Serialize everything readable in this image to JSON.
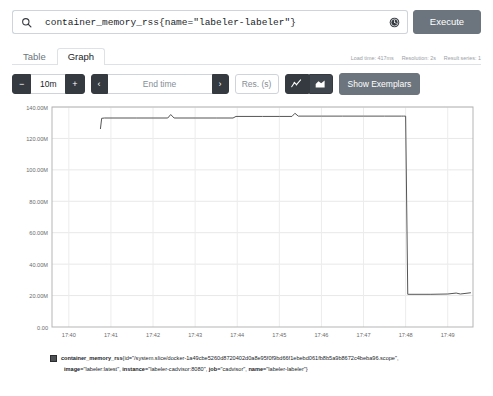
{
  "query": {
    "value": "container_memory_rss{name=\"labeler-labeler\"}",
    "placeholder": "Expression (press Shift+Enter for newlines)",
    "search_icon": "search-icon",
    "history_icon": "history-clock-icon",
    "execute_label": "Execute"
  },
  "tabs": [
    {
      "label": "Table",
      "active": false
    },
    {
      "label": "Graph",
      "active": true
    }
  ],
  "stats": {
    "load_time": "Load time: 417ms",
    "resolution": "Resolution: 2s",
    "result_series": "Result series: 1"
  },
  "toolbar": {
    "decrease_label": "−",
    "range_value": "10m",
    "increase_label": "+",
    "prev_label": "‹",
    "end_time_placeholder": "End time",
    "next_label": "›",
    "resolution_placeholder": "Res. (s)",
    "line_chart_icon": "line-chart-icon",
    "stacked_chart_icon": "stacked-area-chart-icon",
    "show_exemplars_label": "Show Exemplars"
  },
  "legend": {
    "swatch_color": "#4f5255",
    "metric": "container_memory_rss",
    "line1": "{id=\"/system.slice/docker-1a49cbe5260d8720402d0a8e95f0f9bd66f1ebebd061fb8b5a9b8672c4beba96.scope\",",
    "labels": [
      {
        "key": "image",
        "value": "\"labeler:latest\""
      },
      {
        "key": "instance",
        "value": "\"labeler-cadvisor:8080\""
      },
      {
        "key": "job",
        "value": "\"cadvisor\""
      },
      {
        "key": "name",
        "value": "\"labeler-labeler\""
      }
    ],
    "closing": "}"
  },
  "chart_data": {
    "type": "line",
    "title": "",
    "xlabel": "",
    "ylabel": "",
    "unit": "bytes",
    "grid": true,
    "legend_position": "bottom",
    "series_color": "#555555",
    "ylim": [
      0,
      140000000
    ],
    "ytick_labels": [
      "0.00",
      "20.00M",
      "40.00M",
      "60.00M",
      "80.00M",
      "100.00M",
      "120.00M",
      "140.00M"
    ],
    "ytick_values": [
      0,
      20000000,
      40000000,
      60000000,
      80000000,
      100000000,
      120000000,
      140000000
    ],
    "xtick_labels": [
      "17:40",
      "17:41",
      "17:42",
      "17:43",
      "17:44",
      "17:45",
      "17:46",
      "17:47",
      "17:48",
      "17:49"
    ],
    "xlim": [
      "17:39.6",
      "17:49.6"
    ],
    "series": [
      {
        "name": "container_memory_rss{name=\"labeler-labeler\"}",
        "x": [
          "17:40.75",
          "17:40.78",
          "17:40.85",
          "17:41.0",
          "17:41.6",
          "17:42.0",
          "17:42.35",
          "17:42.42",
          "17:42.5",
          "17:43.0",
          "17:43.5",
          "17:43.9",
          "17:43.97",
          "17:44.6",
          "17:45.0",
          "17:45.3",
          "17:45.37",
          "17:45.45",
          "17:46.0",
          "17:46.5",
          "17:47.0",
          "17:47.5",
          "17:47.9",
          "17:47.95",
          "17:48.0",
          "17:48.05",
          "17:48.6",
          "17:49.0",
          "17:49.2",
          "17:49.3",
          "17:49.55"
        ],
        "y": [
          126000000,
          132800000,
          133000000,
          133000000,
          133000000,
          133000000,
          133000000,
          135200000,
          133000000,
          133000000,
          133000000,
          133000000,
          134000000,
          134000000,
          134000000,
          134000000,
          136000000,
          134200000,
          134200000,
          134200000,
          134200000,
          134200000,
          134200000,
          134200000,
          134200000,
          20800000,
          20800000,
          21000000,
          21600000,
          21000000,
          21800000
        ]
      }
    ]
  }
}
